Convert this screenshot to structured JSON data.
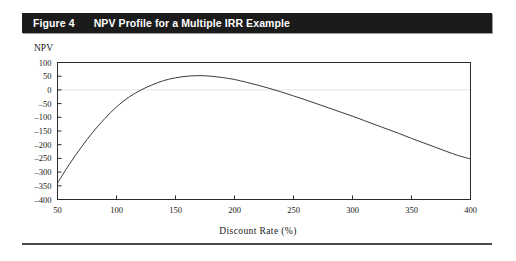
{
  "figure": {
    "label": "Figure 4",
    "title": "NPV Profile for a Multiple IRR Example",
    "title_bar_color": "#1b1b1b",
    "title_text_color": "#ffffff"
  },
  "chart_data": {
    "type": "line",
    "title": "NPV Profile for a Multiple IRR Example",
    "xlabel": "Discount Rate (%)",
    "ylabel": "NPV",
    "xlim": [
      50,
      400
    ],
    "ylim": [
      -400,
      100
    ],
    "grid": false,
    "legend": null,
    "zero_line": 0,
    "axis_line_color": "#2b2b2b",
    "series_color": "#3b3b3b",
    "xticks": [
      50,
      100,
      150,
      200,
      250,
      300,
      350,
      400
    ],
    "xtick_labels": [
      "50",
      "100",
      "150",
      "200",
      "250",
      "300",
      "350",
      "400"
    ],
    "yticks": [
      100,
      50,
      0,
      -50,
      -100,
      -150,
      -200,
      -250,
      -300,
      -350,
      -400
    ],
    "ytick_labels": [
      "100",
      "50",
      "0",
      "–50",
      "–100",
      "–150",
      "–200",
      "–250",
      "–300",
      "–350",
      "–400"
    ],
    "series": [
      {
        "name": "NPV",
        "x": [
          50,
          60,
          70,
          80,
          90,
          100,
          110,
          120,
          130,
          140,
          150,
          160,
          170,
          180,
          190,
          200,
          210,
          220,
          230,
          240,
          250,
          260,
          270,
          280,
          290,
          300,
          310,
          320,
          330,
          340,
          350,
          360,
          370,
          380,
          390,
          400
        ],
        "values": [
          -340,
          -272,
          -210,
          -154,
          -105,
          -62,
          -28,
          -2,
          18,
          34,
          44,
          50,
          52,
          50,
          45,
          38,
          28,
          17,
          5,
          -8,
          -22,
          -36,
          -51,
          -66,
          -81,
          -96,
          -112,
          -128,
          -144,
          -160,
          -177,
          -193,
          -209,
          -225,
          -240,
          -252
        ]
      }
    ]
  }
}
